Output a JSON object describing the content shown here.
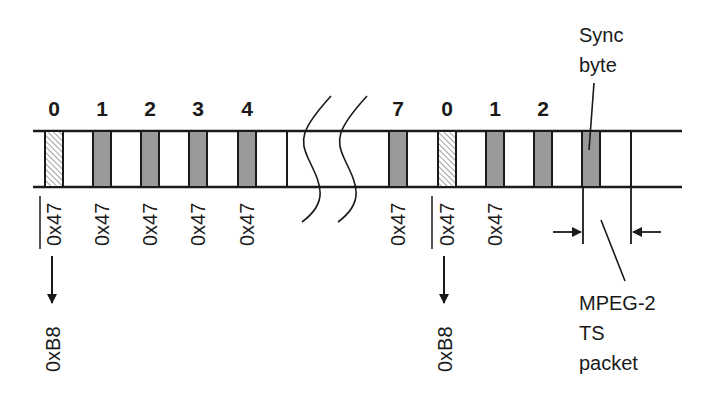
{
  "diagram": {
    "colors": {
      "line": "#1a1a1a",
      "sync_fill": "#999999",
      "inverted_fill_hatch": "#888888",
      "background": "#ffffff"
    },
    "packets_left": [
      {
        "index": "0",
        "sync_value": "0x47",
        "inverted": true,
        "arrow_label": "0xB8"
      },
      {
        "index": "1",
        "sync_value": "0x47",
        "inverted": false
      },
      {
        "index": "2",
        "sync_value": "0x47",
        "inverted": false
      },
      {
        "index": "3",
        "sync_value": "0x47",
        "inverted": false
      },
      {
        "index": "4",
        "sync_value": "0x47",
        "inverted": false
      }
    ],
    "packets_right": [
      {
        "index": "7",
        "sync_value": "0x47",
        "inverted": false
      },
      {
        "index": "0",
        "sync_value": "0x47",
        "inverted": true,
        "arrow_label": "0xB8"
      },
      {
        "index": "1",
        "sync_value": "0x47",
        "inverted": false
      },
      {
        "index": "2",
        "sync_value": "",
        "inverted": false
      }
    ],
    "break_symbol": "wavy-break",
    "callouts": {
      "sync_byte": "Sync byte",
      "sync_byte_line1": "Sync",
      "sync_byte_line2": "byte",
      "packet_line1": "MPEG-2",
      "packet_line2": "TS",
      "packet_line3": "packet"
    }
  }
}
